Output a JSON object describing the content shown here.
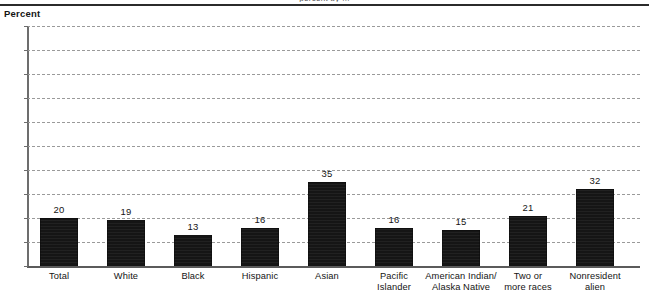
{
  "page": {
    "top_clipped_text": "percent by ...",
    "axis_unit_label": "Percent"
  },
  "chart_data": {
    "type": "bar",
    "title": "",
    "subtitle": "",
    "xlabel": "",
    "ylabel": "Percent",
    "ylim": [
      0,
      100
    ],
    "ytick_step": 10,
    "yticks": [
      100,
      90,
      80,
      70,
      60,
      50,
      40,
      30,
      20,
      10,
      0
    ],
    "grid": true,
    "grid_style": "dashed-horizontal",
    "legend": false,
    "bar_color": "#151515",
    "categories": [
      "Total",
      "White",
      "Black",
      "Hispanic",
      "Asian",
      "Pacific\nIslander",
      "American Indian/\nAlaska Native",
      "Two or\nmore races",
      "Nonresident\nalien"
    ],
    "values": [
      20,
      19,
      13,
      16,
      35,
      16,
      15,
      21,
      32
    ],
    "value_labels": [
      "20",
      "19",
      "13",
      "16",
      "35",
      "16",
      "15",
      "21",
      "32"
    ]
  }
}
